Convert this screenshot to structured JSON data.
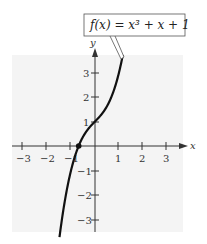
{
  "chart_data": {
    "type": "line",
    "title": "f(x) = x³ + x + 1",
    "function": "x^3 + x + 1",
    "xlabel": "x",
    "ylabel": "y",
    "xlim": [
      -3.5,
      3.5
    ],
    "ylim": [
      -3.5,
      3.8
    ],
    "x_ticks": [
      -3,
      -2,
      -1,
      1,
      2,
      3
    ],
    "x_tick_labels": [
      "−3",
      "−2",
      "−1",
      "1",
      "2",
      "3"
    ],
    "y_ticks": [
      -3,
      -2,
      -1,
      1,
      2,
      3
    ],
    "y_tick_labels": [
      "−3",
      "−2",
      "−1",
      "1",
      "2",
      "3"
    ],
    "grid": false,
    "series": [
      {
        "name": "f(x) = x³ + x + 1",
        "x": [
          -1.48,
          -1.3,
          -1.1,
          -0.9,
          -0.68,
          -0.5,
          -0.3,
          0,
          0.3,
          0.5,
          0.8,
          1.0,
          1.16
        ],
        "y": [
          -3.72,
          -2.5,
          -1.43,
          -0.63,
          0.0,
          0.38,
          0.67,
          1.0,
          1.33,
          1.63,
          2.31,
          3.0,
          3.72
        ]
      }
    ],
    "annotations": [
      {
        "type": "point",
        "label": "x-intercept",
        "x": -0.68,
        "y": 0
      },
      {
        "type": "callout",
        "text": "f(x) = x³ + x + 1",
        "points_to": [
          1.16,
          3.72
        ]
      }
    ]
  },
  "labels": {
    "function_callout": "f(x) = x³ + x + 1",
    "x_axis": "x",
    "y_axis": "y",
    "x_ticks": [
      "−3",
      "−2",
      "−1",
      "1",
      "2",
      "3"
    ],
    "y_ticks_pos": [
      "1",
      "2",
      "3"
    ],
    "y_ticks_neg": [
      "−1",
      "−2",
      "−3"
    ]
  },
  "colors": {
    "background_panel": "#f4f4f4",
    "curve": "#111111",
    "axes": "#333333"
  }
}
